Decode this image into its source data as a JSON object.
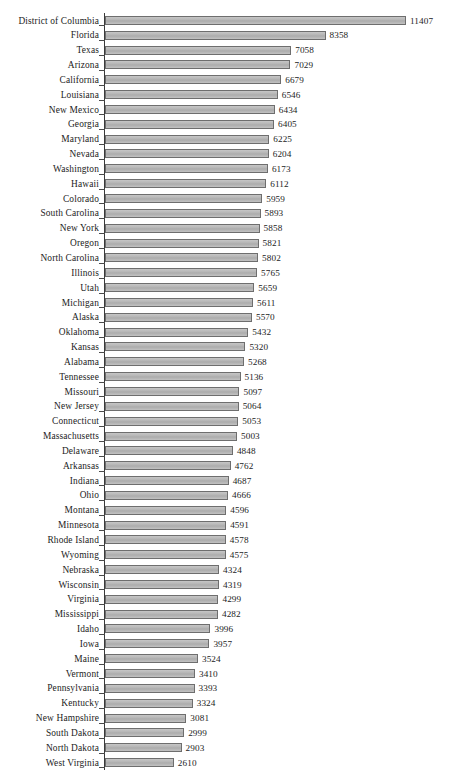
{
  "chart": {
    "type": "barh",
    "title": "",
    "xlabel": "",
    "ylabel": "",
    "axis_color": "#3a3a3a",
    "bar_fill": "#b9b9b9",
    "bar_border": "#6e6e6e",
    "background": "#ffffff",
    "grid": false,
    "legend": null,
    "xlim": [
      0,
      11407
    ],
    "sort_order": "descending"
  },
  "chart_data": {
    "type": "bar",
    "orientation": "horizontal",
    "title": "",
    "xlabel": "",
    "ylabel": "",
    "xlim": [
      0,
      11407
    ],
    "grid": false,
    "legend_position": "none",
    "categories": [
      "District of Columbia",
      "Florida",
      "Texas",
      "Arizona",
      "California",
      "Louisiana",
      "New Mexico",
      "Georgia",
      "Maryland",
      "Nevada",
      "Washington",
      "Hawaii",
      "Colorado",
      "South Carolina",
      "New York",
      "Oregon",
      "North Carolina",
      "Illinois",
      "Utah",
      "Michigan",
      "Alaska",
      "Oklahoma",
      "Kansas",
      "Alabama",
      "Tennessee",
      "Missouri",
      "New Jersey",
      "Connecticut",
      "Massachusetts",
      "Delaware",
      "Arkansas",
      "Indiana",
      "Ohio",
      "Montana",
      "Minnesota",
      "Rhode Island",
      "Wyoming",
      "Nebraska",
      "Wisconsin",
      "Virginia",
      "Mississippi",
      "Idaho",
      "Iowa",
      "Maine",
      "Vermont",
      "Pennsylvania",
      "Kentucky",
      "New Hampshire",
      "South Dakota",
      "North Dakota",
      "West Virginia"
    ],
    "values": [
      11407,
      8358,
      7058,
      7029,
      6679,
      6546,
      6434,
      6405,
      6225,
      6204,
      6173,
      6112,
      5959,
      5893,
      5858,
      5821,
      5802,
      5765,
      5659,
      5611,
      5570,
      5432,
      5320,
      5268,
      5136,
      5097,
      5064,
      5053,
      5003,
      4848,
      4762,
      4687,
      4666,
      4596,
      4591,
      4578,
      4575,
      4324,
      4319,
      4299,
      4282,
      3996,
      3957,
      3524,
      3410,
      3393,
      3324,
      3081,
      2999,
      2903,
      2610
    ]
  }
}
